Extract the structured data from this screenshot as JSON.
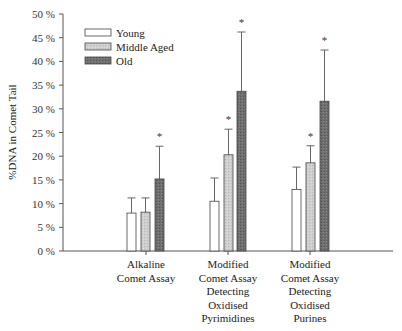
{
  "chart_data": {
    "type": "bar",
    "title": "",
    "xlabel": "",
    "ylabel": "%DNA in Comet Tail",
    "ylim": [
      0,
      50
    ],
    "yticks": [
      "0 %",
      "5 %",
      "10 %",
      "15 %",
      "20 %",
      "25 %",
      "30 %",
      "35 %",
      "40 %",
      "45 %",
      "50 %"
    ],
    "grid": false,
    "legend_position": "upper-left",
    "categories": [
      [
        "Alkaline",
        "Comet Assay"
      ],
      [
        "Modified",
        "Comet Assay",
        "Detecting",
        "Oxidised",
        "Pyrimidines"
      ],
      [
        "Modified",
        "Comet Assay",
        "Detecting",
        "Oxidised",
        "Purines"
      ]
    ],
    "series": [
      {
        "name": "Young",
        "color": "#ffffff",
        "values": [
          8.0,
          10.5,
          13.0
        ],
        "error_upper": [
          11.2,
          15.4,
          17.7
        ],
        "significant": [
          false,
          false,
          false
        ]
      },
      {
        "name": "Middle Aged",
        "color": "#c9c9c9",
        "values": [
          8.2,
          20.3,
          18.6
        ],
        "error_upper": [
          11.2,
          25.7,
          22.2
        ],
        "significant": [
          false,
          true,
          true
        ]
      },
      {
        "name": "Old",
        "color": "#6e6e6e",
        "values": [
          15.2,
          33.7,
          31.6
        ],
        "error_upper": [
          22.1,
          46.2,
          42.4
        ],
        "significant": [
          true,
          true,
          true
        ]
      }
    ],
    "annotations": [
      "*"
    ]
  }
}
